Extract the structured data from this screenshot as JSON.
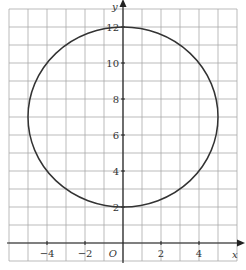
{
  "chart_data": {
    "type": "line",
    "title": "",
    "xlabel": "x",
    "ylabel": "y",
    "origin_label": "O",
    "xlim": [
      -6,
      6
    ],
    "ylim": [
      -1,
      13
    ],
    "grid": true,
    "x_ticks": [
      -4,
      -2,
      2,
      4
    ],
    "x_tick_labels": [
      "−4",
      "−2",
      "2",
      "4"
    ],
    "y_ticks": [
      2,
      4,
      6,
      8,
      10,
      12
    ],
    "y_tick_labels": [
      "2",
      "4",
      "6",
      "8",
      "10",
      "12"
    ],
    "series": [
      {
        "name": "circle",
        "shape": "circle",
        "center": [
          0,
          7
        ],
        "radius": 5,
        "equation": "x^2 + (y-7)^2 = 25",
        "color": "#333333"
      }
    ]
  },
  "colors": {
    "grid": "#aaaaaa",
    "axis": "#222222",
    "curve": "#333333"
  }
}
